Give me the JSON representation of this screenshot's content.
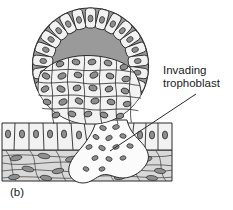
{
  "figure": {
    "panel_label": "(b)",
    "labels": [
      {
        "id": "invading-trophoblast",
        "line1": "Invading",
        "line2": "trophoblast"
      }
    ],
    "colors": {
      "outline": "#2b2b2b",
      "blastocoel_fill": "#9a9a9a",
      "cell_fill": "#f2f2f2",
      "nucleus_fill": "#8e8e8e",
      "stroma_fill": "#d8d8d8",
      "trophoblast_mass_fill": "#fbfbfb",
      "background": "#ffffff",
      "text": "#1a1a1a"
    },
    "structures": [
      {
        "name": "blastocyst",
        "description": "spherical embryo at top"
      },
      {
        "name": "trophoblast-ring",
        "description": "ring of outer cells around blastocyst"
      },
      {
        "name": "blastocoel-cavity",
        "description": "gray fluid filled cavity"
      },
      {
        "name": "inner-cell-mass",
        "description": "cluster of cells in lower half of blastocyst"
      },
      {
        "name": "uterine-epithelium",
        "description": "row of columnar cells forming surface"
      },
      {
        "name": "endometrial-stroma",
        "description": "spindle cell connective tissue"
      },
      {
        "name": "invading-trophoblast-mass",
        "description": "lobed mass penetrating epithelium and stroma"
      }
    ]
  }
}
